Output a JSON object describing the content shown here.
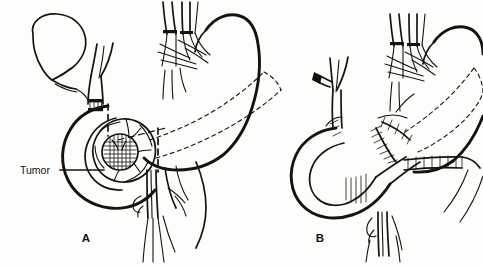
{
  "figure": {
    "kind": "medical-line-illustration",
    "background_color": "#fdfdfb",
    "ink_color": "#16120f",
    "panels": [
      {
        "id": "A",
        "label": "A",
        "caption": "Resection phase: tumor in pancreatic head with dashed resection lines",
        "annotations": [
          {
            "name": "tumor",
            "label": "Tumor",
            "leader_line": true,
            "target": "hatched mass in pancreatic head"
          }
        ],
        "structures": [
          "gallbladder",
          "cystic-duct",
          "common-bile-duct",
          "ligature-band",
          "celiac-vessel-bundle",
          "stomach",
          "duodenum",
          "pancreas-body-tail",
          "pancreatic-head-tumor",
          "superior-mesenteric-vessels",
          "dashed-resection-line-stomach",
          "dashed-resection-line-pancreas",
          "dashed-resection-line-bile-duct"
        ]
      },
      {
        "id": "B",
        "label": "B",
        "caption": "Reconstruction phase: anastomoses with suture lines",
        "annotations": [],
        "structures": [
          "clipped-cystic-duct-stump",
          "hepaticojejunostomy-duct",
          "celiac-vessel-bundle",
          "stomach-remnant",
          "jejunal-loop",
          "pancreaticojejunostomy-sutures",
          "gastrojejunostomy-sutures",
          "superior-mesenteric-vessels",
          "dashed-outline-pancreas-remnant"
        ]
      }
    ]
  },
  "labels": {
    "tumor": "Tumor",
    "panel_a": "A",
    "panel_b": "B"
  }
}
